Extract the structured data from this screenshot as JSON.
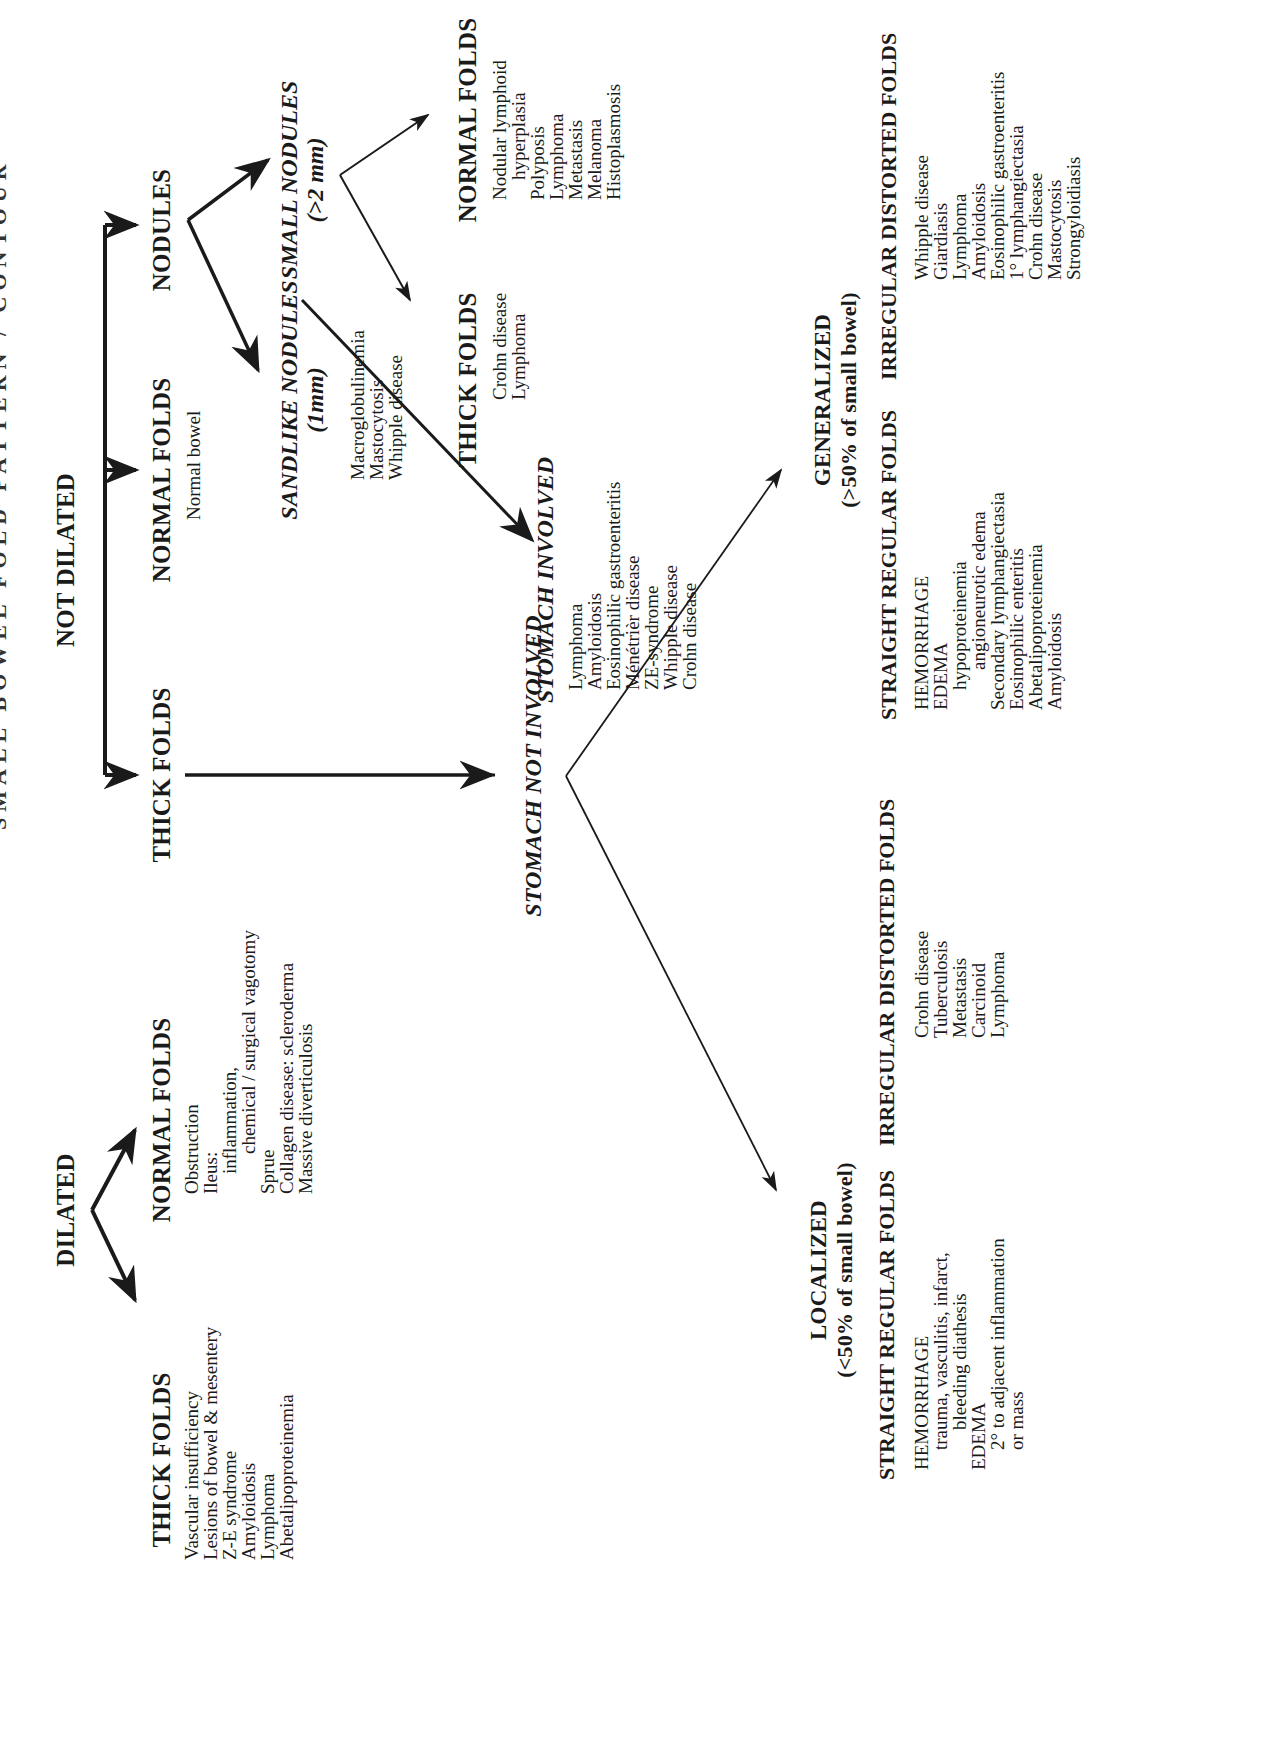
{
  "title_fragment": "SMALL BOWEL FOLD PATTERN / CONTOUR",
  "root": {
    "dilated": {
      "label": "DILATED",
      "thick_folds": {
        "heading": "THICK FOLDS",
        "items": [
          "Vascular insufficiency",
          "Lesions of bowel & mesentery",
          "Z-E syndrome",
          "Amyloidosis",
          "Lymphoma",
          "Abetalipoproteinemia"
        ]
      },
      "normal_folds": {
        "heading": "NORMAL FOLDS",
        "items": [
          {
            "text": "Obstruction",
            "indent": 0
          },
          {
            "text": "Ileus:",
            "indent": 0
          },
          {
            "text": "inflammation,",
            "indent": 1
          },
          {
            "text": "chemical / surgical vagotomy",
            "indent": 2
          },
          {
            "text": "Sprue",
            "indent": 0
          },
          {
            "text": "Collagen disease: scleroderma",
            "indent": 0
          },
          {
            "text": "Massive diverticulosis",
            "indent": 0
          }
        ]
      }
    },
    "not_dilated": {
      "label": "NOT DILATED",
      "thick_folds": {
        "heading": "THICK FOLDS",
        "stomach_involved": {
          "heading": "STOMACH INVOLVED",
          "items": [
            "Lymphoma",
            "Amyloidosis",
            "Eosinophilic gastroenteritis",
            "Ménétrièr disease",
            "ZE-syndrome",
            "Whipple disease",
            "Crohn disease"
          ]
        },
        "stomach_not_involved": {
          "heading": "STOMACH NOT INVOLVED",
          "localized": {
            "heading": "LOCALIZED",
            "subheading": "(<50% of small bowel)",
            "straight_regular": {
              "heading": "STRAIGHT REGULAR FOLDS",
              "items": [
                {
                  "text": "HEMORRHAGE",
                  "indent": 0
                },
                {
                  "text": "trauma, vasculitis, infarct,",
                  "indent": 1
                },
                {
                  "text": "bleeding diathesis",
                  "indent": 2
                },
                {
                  "text": "EDEMA",
                  "indent": 0
                },
                {
                  "text": "2° to adjacent inflammation",
                  "indent": 1
                },
                {
                  "text": "or mass",
                  "indent": 1
                }
              ]
            },
            "irregular_distorted": {
              "heading": "IRREGULAR DISTORTED FOLDS",
              "items": [
                "Crohn disease",
                "Tuberculosis",
                "Metastasis",
                "Carcinoid",
                "Lymphoma"
              ]
            }
          },
          "generalized": {
            "heading": "GENERALIZED",
            "subheading": "(>50% of small bowel)",
            "straight_regular": {
              "heading": "STRAIGHT REGULAR FOLDS",
              "items": [
                {
                  "text": "HEMORRHAGE",
                  "indent": 0
                },
                {
                  "text": "EDEMA",
                  "indent": 0
                },
                {
                  "text": "hypoproteinemia",
                  "indent": 1
                },
                {
                  "text": "angioneurotic edema",
                  "indent": 2
                },
                {
                  "text": "Secondary lymphangiectasia",
                  "indent": 0
                },
                {
                  "text": "Eosinophilic enteritis",
                  "indent": 0
                },
                {
                  "text": "Abetalipoproteinemia",
                  "indent": 0
                },
                {
                  "text": "Amyloidosis",
                  "indent": 0
                }
              ]
            },
            "irregular_distorted": {
              "heading": "IRREGULAR DISTORTED FOLDS",
              "items": [
                "Whipple disease",
                "Giardiasis",
                "Lymphoma",
                "Amyloidosis",
                "Eosinophilic gastroenteritis",
                "1° lymphangiectasia",
                "Crohn disease",
                "Mastocytosis",
                "Strongyloidiasis"
              ]
            }
          }
        }
      },
      "normal_folds": {
        "heading": "NORMAL FOLDS",
        "items": [
          "Normal bowel"
        ]
      },
      "nodules": {
        "heading": "NODULES",
        "sandlike": {
          "heading": "SANDLIKE NODULES",
          "size": "(1mm)",
          "items": [
            "Macroglobulinemia",
            "Mastocytosis",
            "Whipple disease"
          ]
        },
        "small": {
          "heading": "SMALL NODULES",
          "size": "(>2 mm)",
          "thick_folds": {
            "heading": "THICK FOLDS",
            "items": [
              "Crohn disease",
              "Lymphoma"
            ]
          },
          "normal_folds": {
            "heading": "NORMAL FOLDS",
            "items": [
              {
                "text": "Nodular lymphoid",
                "indent": 0
              },
              {
                "text": "hyperplasia",
                "indent": 1
              },
              {
                "text": "Polyposis",
                "indent": 0
              },
              {
                "text": "Lymphoma",
                "indent": 0
              },
              {
                "text": "Metastasis",
                "indent": 0
              },
              {
                "text": "Melanoma",
                "indent": 0
              },
              {
                "text": "Histoplasmosis",
                "indent": 0
              }
            ]
          }
        }
      }
    }
  },
  "colors": {
    "ink": "#1a1a1a",
    "background": "#ffffff"
  }
}
